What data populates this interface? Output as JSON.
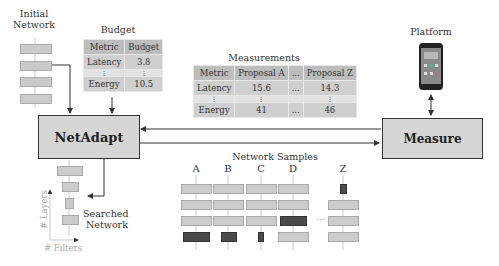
{
  "labels": {
    "initial_network": [
      "Initial",
      "Network"
    ],
    "budget": "Budget",
    "measurements": "Measurements",
    "platform": "Platform",
    "network_samples": "Network  Samples",
    "searched_network": [
      "Searched",
      "Network"
    ],
    "axis_layers": "# Layers",
    "axis_filters": "# Filters",
    "ellipsis": "..."
  },
  "boxes": {
    "netadapt": "NetAdapt",
    "measure": "Measure"
  },
  "budget_table": {
    "headers": [
      "Metric",
      "Budget"
    ],
    "rows": [
      [
        "Latency",
        "3.8"
      ],
      [
        "⋮",
        "⋮"
      ],
      [
        "Energy",
        "10.5"
      ]
    ]
  },
  "measurements_table": {
    "headers": [
      "Metric",
      "Proposal A",
      "...",
      "Proposal Z"
    ],
    "rows": [
      [
        "Latency",
        "15.6",
        "...",
        "14.3"
      ],
      [
        "⋮",
        "⋮",
        "",
        "⋮"
      ],
      [
        "Energy",
        "41",
        "...",
        "46"
      ]
    ]
  },
  "samples": {
    "columns": [
      "A",
      "B",
      "C",
      "D",
      "Z"
    ]
  },
  "colors": {
    "layer": "#cbcbcb",
    "layer_dark": "#4a4a4a",
    "box": "#d6d6d6",
    "table_header": "#bdbdbd",
    "table_cell": "#cfcfcf"
  }
}
